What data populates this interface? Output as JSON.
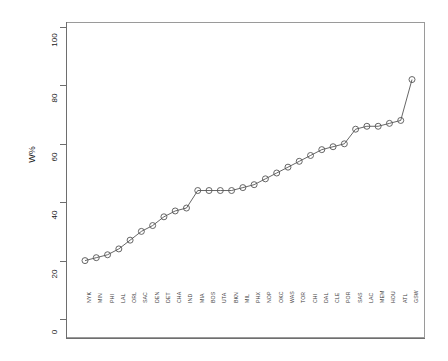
{
  "chart_data": {
    "type": "line",
    "title": "",
    "xlabel": "",
    "ylabel": "W%",
    "ylim": [
      0,
      100
    ],
    "yticks": [
      0,
      20,
      40,
      60,
      80,
      100
    ],
    "grid": false,
    "legend": "none",
    "marker": "open-circle",
    "categories": [
      "NYK",
      "MIN",
      "PHI",
      "LAL",
      "ORL",
      "SAC",
      "DEN",
      "DET",
      "CHA",
      "IND",
      "MIA",
      "BOS",
      "UTA",
      "BKN",
      "MIL",
      "PHX",
      "NOP",
      "OKC",
      "WAS",
      "TOR",
      "CHI",
      "DAL",
      "CLE",
      "POR",
      "SAS",
      "LAC",
      "MEM",
      "HOU",
      "ATL",
      "GSW"
    ],
    "values": [
      20,
      21,
      22,
      24,
      27,
      30,
      32,
      35,
      37,
      38,
      44,
      44,
      44,
      44,
      45,
      46,
      48,
      50,
      52,
      54,
      56,
      58,
      59,
      60,
      65,
      66,
      66,
      67,
      68,
      82
    ],
    "series": [
      {
        "name": "W%",
        "values": [
          20,
          21,
          22,
          24,
          27,
          30,
          32,
          35,
          37,
          38,
          44,
          44,
          44,
          44,
          45,
          46,
          48,
          50,
          52,
          54,
          56,
          58,
          59,
          60,
          65,
          66,
          66,
          67,
          68,
          82
        ]
      }
    ]
  },
  "colors": {
    "line": "#555555",
    "marker_stroke": "#555555",
    "frame": "#9a9a9a",
    "axis": "#6e6e6e",
    "text": "#1a1a1a",
    "background": "#ffffff"
  }
}
